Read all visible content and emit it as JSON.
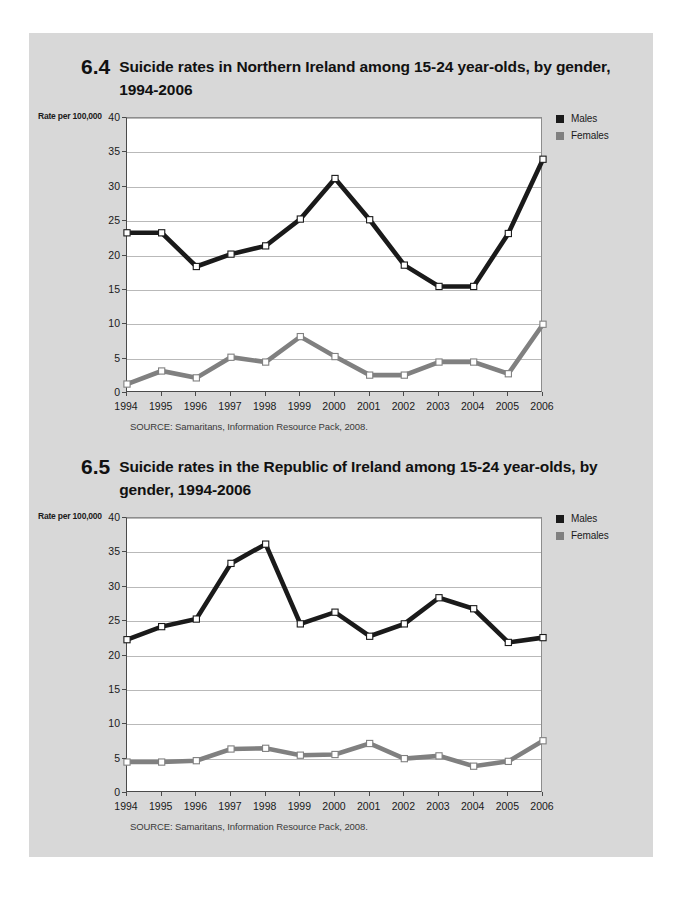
{
  "page": {
    "background_color": "#d8d8d8",
    "margin_color": "#ffffff"
  },
  "colors": {
    "males": "#1a1a1a",
    "females": "#808080",
    "marker_fill": "#ffffff",
    "grid": "#b9b9b9",
    "axis": "#4a4a4a",
    "plot_background": "#ffffff"
  },
  "figures": [
    {
      "number": "6.4",
      "title": "Suicide rates in Northern Ireland among 15-24 year-olds, by gender, 1994-2006",
      "axis_title": "Rate per 100,000",
      "source": "SOURCE: Samaritans, Information Resource Pack, 2008.",
      "legend": [
        {
          "label": "Males",
          "color": "#1a1a1a"
        },
        {
          "label": "Females",
          "color": "#808080"
        }
      ],
      "chart_data": {
        "type": "line",
        "title": "Suicide rates in Northern Ireland among 15-24 year-olds, by gender, 1994-2006",
        "xlabel": "",
        "ylabel": "Rate per 100,000",
        "ylim": [
          0,
          40
        ],
        "yticks": [
          0,
          5,
          10,
          15,
          20,
          25,
          30,
          35,
          40
        ],
        "grid": true,
        "legend_position": "top-right",
        "categories": [
          "1994",
          "1995",
          "1996",
          "1997",
          "1998",
          "1999",
          "2000",
          "2001",
          "2002",
          "2003",
          "2004",
          "2005",
          "2006"
        ],
        "series": [
          {
            "name": "Males",
            "color": "#1a1a1a",
            "values": [
              23.3,
              23.3,
              18.4,
              20.2,
              21.4,
              25.3,
              31.2,
              25.2,
              18.6,
              15.5,
              15.5,
              23.2,
              34.0
            ]
          },
          {
            "name": "Females",
            "color": "#808080",
            "values": [
              1.3,
              3.2,
              2.2,
              5.2,
              4.5,
              8.2,
              5.3,
              2.6,
              2.6,
              4.5,
              4.5,
              2.8,
              10.0
            ]
          }
        ]
      }
    },
    {
      "number": "6.5",
      "title": "Suicide rates in the Republic of Ireland among 15-24 year-olds, by gender, 1994-2006",
      "axis_title": "Rate per 100,000",
      "source": "SOURCE: Samaritans, Information Resource Pack, 2008.",
      "legend": [
        {
          "label": "Males",
          "color": "#1a1a1a"
        },
        {
          "label": "Females",
          "color": "#808080"
        }
      ],
      "chart_data": {
        "type": "line",
        "title": "Suicide rates in the Republic of Ireland among 15-24 year-olds, by gender, 1994-2006",
        "xlabel": "",
        "ylabel": "Rate per 100,000",
        "ylim": [
          0,
          40
        ],
        "yticks": [
          0,
          5,
          10,
          15,
          20,
          25,
          30,
          35,
          40
        ],
        "grid": true,
        "legend_position": "top-right",
        "categories": [
          "1994",
          "1995",
          "1996",
          "1997",
          "1998",
          "1999",
          "2000",
          "2001",
          "2002",
          "2003",
          "2004",
          "2005",
          "2006"
        ],
        "series": [
          {
            "name": "Males",
            "color": "#1a1a1a",
            "values": [
              22.3,
              24.2,
              25.3,
              33.4,
              36.2,
              24.6,
              26.3,
              22.8,
              24.6,
              28.4,
              26.8,
              21.9,
              22.6
            ]
          },
          {
            "name": "Females",
            "color": "#808080",
            "values": [
              4.5,
              4.5,
              4.7,
              6.4,
              6.5,
              5.5,
              5.6,
              7.2,
              5.0,
              5.4,
              3.9,
              4.6,
              7.6
            ]
          }
        ]
      }
    }
  ]
}
